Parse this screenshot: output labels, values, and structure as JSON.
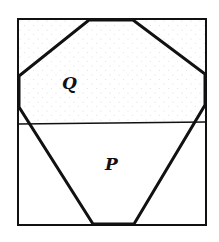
{
  "diagram": {
    "type": "geometric-figure",
    "colors": {
      "stroke": "#111111",
      "background": "#ffffff",
      "stipple": "#d8d8d8"
    },
    "outer_rectangle": {
      "x1": 18,
      "y1": 19,
      "x2": 206,
      "y2": 225
    },
    "divider_line": {
      "x1": 18,
      "y1": 124,
      "x2": 206,
      "y2": 122
    },
    "polygon_points": [
      [
        89,
        20
      ],
      [
        133,
        20
      ],
      [
        205,
        74
      ],
      [
        205,
        105
      ],
      [
        134,
        224
      ],
      [
        93,
        224
      ],
      [
        19,
        107
      ],
      [
        19,
        76
      ]
    ],
    "regions": [
      {
        "id": "Q",
        "label": "Q",
        "label_x": 70,
        "label_y": 89,
        "shaded": true
      },
      {
        "id": "P",
        "label": "P",
        "label_x": 113,
        "label_y": 170,
        "shaded": false
      }
    ]
  }
}
